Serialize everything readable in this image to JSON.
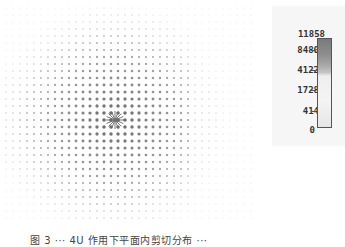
{
  "figure": {
    "type": "vector-field-plot",
    "source_center": {
      "x": 115,
      "y": 120
    },
    "grid_spacing_px": 7
  },
  "chart_data": {
    "type": "heatmap",
    "title": "",
    "colorbar": {
      "ticks": [
        "11858",
        "8480",
        "4122",
        "1728",
        "414",
        "0"
      ],
      "values": [
        11858,
        8480,
        4122,
        1728,
        414,
        0
      ],
      "colors": [
        "#7a7a7a",
        "#9a9a9a",
        "#bdbdbd",
        "#f0f0f0",
        "#f6f6f6",
        "#e4e4e4"
      ]
    },
    "peak_location": "center-left of field",
    "xlabel": "",
    "ylabel": ""
  },
  "legend": {
    "labels": [
      "11858",
      "8480",
      "4122",
      "1728",
      "414",
      "0"
    ]
  },
  "caption": {
    "text": "图 3 ··· 4U 作用下平面内剪切分布 ···"
  }
}
